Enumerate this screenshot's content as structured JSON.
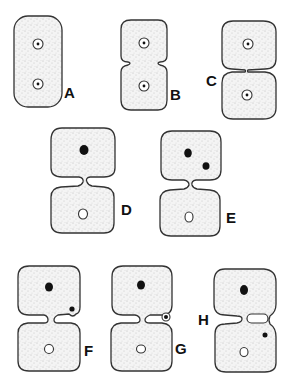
{
  "figure": {
    "type": "cell division stages diagram",
    "background": "#ffffff",
    "stroke_color": "#333333",
    "fill_style": "stippled",
    "panels": [
      {
        "id": "A",
        "label": "A",
        "description": "single elongated cell with two ringed nuclei"
      },
      {
        "id": "B",
        "label": "B",
        "description": "cell beginning to constrict, two ringed nuclei"
      },
      {
        "id": "C",
        "label": "C",
        "description": "deep constriction, two ringed nuclei"
      },
      {
        "id": "D",
        "label": "D",
        "description": "upper cell with solid nucleus, lower cell with open nucleus"
      },
      {
        "id": "E",
        "label": "E",
        "description": "upper cell with two solid bodies, lower cell with open nucleus"
      },
      {
        "id": "F",
        "label": "F",
        "description": "small body at constriction edge of upper cell"
      },
      {
        "id": "G",
        "label": "G",
        "description": "ringed body passing through constriction"
      },
      {
        "id": "H",
        "label": "H",
        "description": "body moved into lower cell via side channel"
      }
    ]
  }
}
